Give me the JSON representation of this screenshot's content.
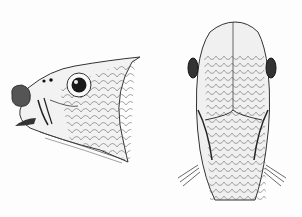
{
  "image": {
    "description": "Engraved illustration of a fish head: lateral view (left) and dorsal view (right)",
    "background": "#fdfdfd",
    "ink": "#2a2a2a",
    "figures": [
      {
        "name": "lateral-view",
        "label": ""
      },
      {
        "name": "dorsal-view",
        "label": ""
      }
    ]
  }
}
